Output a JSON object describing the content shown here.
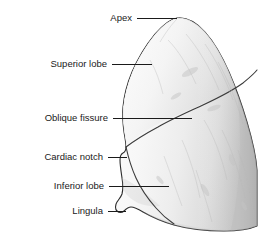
{
  "figure": {
    "view": "lateral",
    "width": 258,
    "height": 242,
    "background_color": "#ffffff",
    "outline_color": "#2b2b2b",
    "fill_light": "#fbfbfb",
    "fill_mid": "#ededed",
    "fill_dark": "#c9c9c9",
    "label_color": "#1a1a1a",
    "leader_color": "#1a1a1a"
  },
  "labels": [
    {
      "id": "apex",
      "text": "Apex",
      "text_x": 132,
      "text_y": 18,
      "leader_x1": 137,
      "leader_y1": 18,
      "leader_x2": 177,
      "leader_y2": 18
    },
    {
      "id": "superior-lobe",
      "text": "Superior lobe",
      "text_x": 107,
      "text_y": 64,
      "leader_x1": 112,
      "leader_y1": 64,
      "leader_x2": 152,
      "leader_y2": 64
    },
    {
      "id": "oblique-fissure",
      "text": "Oblique fissure",
      "text_x": 108,
      "text_y": 118,
      "leader_x1": 113,
      "leader_y1": 118,
      "leader_x2": 192,
      "leader_y2": 118
    },
    {
      "id": "cardiac-notch",
      "text": "Cardiac notch",
      "text_x": 103,
      "text_y": 157,
      "leader_x1": 108,
      "leader_y1": 157,
      "leader_x2": 127,
      "leader_y2": 157
    },
    {
      "id": "inferior-lobe",
      "text": "Inferior lobe",
      "text_x": 104,
      "text_y": 186,
      "leader_x1": 109,
      "leader_y1": 186,
      "leader_x2": 169,
      "leader_y2": 186
    },
    {
      "id": "lingula",
      "text": "Lingula",
      "text_x": 103,
      "text_y": 211,
      "leader_x1": 108,
      "leader_y1": 211,
      "leader_x2": 126,
      "leader_y2": 211
    }
  ]
}
